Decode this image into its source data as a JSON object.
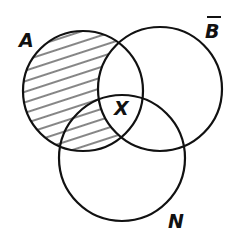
{
  "diagram": {
    "type": "venn",
    "sets": [
      {
        "id": "A",
        "label": "A",
        "cx": 83,
        "cy": 91,
        "r": 60
      },
      {
        "id": "B",
        "label": "B",
        "overline": true,
        "cx": 160,
        "cy": 89,
        "r": 62
      },
      {
        "id": "N",
        "label": "N",
        "cx": 122,
        "cy": 158,
        "r": 63
      }
    ],
    "shaded_region": "A minus B (hatched)",
    "region_labels": [
      {
        "label": "X",
        "region": "A ∩ B ∩ N"
      }
    ],
    "colors": {
      "stroke": "#111111",
      "hatch": "#222222",
      "background": "#ffffff"
    }
  },
  "labels": {
    "a": "A",
    "b": "B",
    "n": "N",
    "x": "X"
  }
}
